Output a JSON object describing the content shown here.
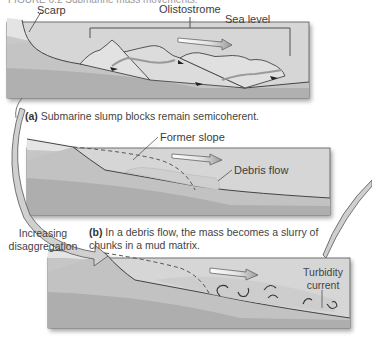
{
  "figure": {
    "header": "FIGURE 6.2 Submarine mass movements.",
    "panels": [
      {
        "id": "a",
        "labels": {
          "scarp": "Scarp",
          "olistostrome": "Olistostrome",
          "sea_level": "Sea level"
        },
        "caption_letter": "(a)",
        "caption_text": "Submarine slump blocks remain semicoherent."
      },
      {
        "id": "b",
        "labels": {
          "former_slope": "Former slope",
          "debris_flow": "Debris flow"
        },
        "caption_letter": "(b)",
        "caption_text": "In a debris flow, the mass becomes a slurry of chunks in a mud matrix."
      },
      {
        "id": "c",
        "labels": {
          "turbidity_line1": "Turbidity",
          "turbidity_line2": "current"
        }
      }
    ],
    "side_label": {
      "line1": "Increasing",
      "line2": "disaggregation"
    },
    "colors": {
      "water": "#d6d6d6",
      "layer_light": "#c4c4c4",
      "layer_mid": "#b3b3b3",
      "layer_dark": "#a2a2a2",
      "outline": "#444444",
      "block_fill": "#dedede",
      "arrow_fill": "#ffffff"
    }
  }
}
